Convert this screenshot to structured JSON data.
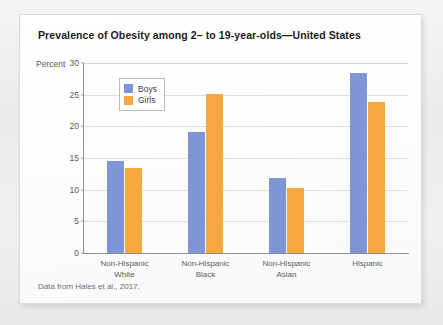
{
  "card": {
    "title": "Prevalence of Obesity among 2– to 19-year-olds—United States",
    "source_note": "Data from Hales et al., 2017."
  },
  "colors": {
    "boys": "#7e95d6",
    "girls": "#f4a83f",
    "axis": "#8e9093",
    "gridline": "#dcdee1",
    "card_background": "#fdfdfd",
    "page_background": "#eceef0",
    "title_text": "#1b1b1b",
    "label_text": "#58595b"
  },
  "chart_data": {
    "type": "bar",
    "title": "Prevalence of Obesity among 2– to 19-year-olds—United States",
    "xlabel": "",
    "ylabel": "Percent",
    "ylim": [
      0,
      30
    ],
    "yticks": [
      0,
      5,
      10,
      15,
      20,
      25,
      30
    ],
    "ytick_labels": [
      "0",
      "5",
      "10",
      "15",
      "20",
      "25",
      "30"
    ],
    "grid": true,
    "legend_position": "top-left inside",
    "categories": [
      "Non-Hispanic White",
      "Non-Hispanic Black",
      "Non-Hispanic Asian",
      "Hispanic"
    ],
    "category_lines": [
      [
        "Non-Hispanic",
        "White"
      ],
      [
        "Non-Hispanic",
        "Black"
      ],
      [
        "Non-Hispanic",
        "Asian"
      ],
      [
        "Hispanic",
        ""
      ]
    ],
    "series": [
      {
        "name": "Boys",
        "color": "#7e95d6",
        "values": [
          14.6,
          19.1,
          11.9,
          28.5
        ]
      },
      {
        "name": "Girls",
        "color": "#f4a83f",
        "values": [
          13.5,
          25.1,
          10.2,
          23.8
        ]
      }
    ]
  }
}
